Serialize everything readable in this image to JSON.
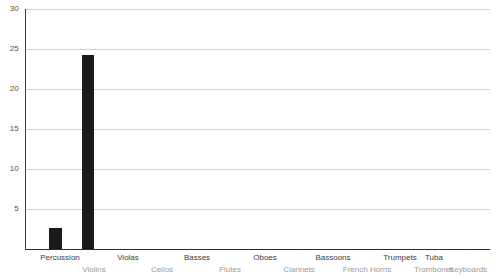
{
  "chart_data": {
    "type": "bar",
    "title": "",
    "subtitle": "",
    "xlabel": "",
    "ylabel": "",
    "ylim": [
      0,
      30
    ],
    "yticks": [
      0,
      5,
      10,
      15,
      20,
      25,
      30
    ],
    "ytick_labels": [
      "5",
      "10",
      "15",
      "20",
      "25",
      "30"
    ],
    "grid": true,
    "legend": "none",
    "bar_color": "#1a1a1a",
    "gridline_color": "#cfcfcf",
    "axis_color": "#2b2b2b",
    "background_color": "#ffffff",
    "label_row_top_color": "#3c3c3c",
    "label_row_bottom_color": "#9a9a9a",
    "categories": [
      "Percussion",
      "Violins",
      "Violas",
      "Cellos",
      "Basses",
      "Flutes",
      "Oboes",
      "Clarinets",
      "Bassoons",
      "French Horns",
      "Trumpets",
      "Trombones",
      "Tuba",
      "Keyboards"
    ],
    "values": [
      2.6,
      24.3,
      0,
      0,
      0,
      0,
      0,
      0,
      0,
      0,
      0,
      0,
      0,
      0
    ],
    "bars": [
      {
        "category": "Percussion",
        "value": 2.6,
        "x": 49,
        "width": 13
      },
      {
        "category": "Violins",
        "value": 24.3,
        "x": 82,
        "width": 12
      }
    ],
    "tick_positions": [
      60,
      94,
      128,
      162,
      197,
      230,
      265,
      299,
      333,
      367,
      400,
      434,
      434,
      468
    ],
    "x_label_rows": [
      {
        "text": "Percussion",
        "x": 60,
        "row": "top"
      },
      {
        "text": "Violins",
        "x": 94,
        "row": "bottom"
      },
      {
        "text": "Violas",
        "x": 128,
        "row": "top"
      },
      {
        "text": "Cellos",
        "x": 162,
        "row": "bottom"
      },
      {
        "text": "Basses",
        "x": 197,
        "row": "top"
      },
      {
        "text": "Flutes",
        "x": 230,
        "row": "bottom"
      },
      {
        "text": "Oboes",
        "x": 265,
        "row": "top"
      },
      {
        "text": "Clarinets",
        "x": 299,
        "row": "bottom"
      },
      {
        "text": "Bassoons",
        "x": 333,
        "row": "top"
      },
      {
        "text": "French Horns",
        "x": 367,
        "row": "bottom"
      },
      {
        "text": "Trumpets",
        "x": 400,
        "row": "top"
      },
      {
        "text": "Trombones",
        "x": 434,
        "row": "bottom"
      },
      {
        "text": "Tuba",
        "x": 434,
        "row": "top"
      },
      {
        "text": "Keyboards",
        "x": 468,
        "row": "bottom"
      }
    ]
  }
}
